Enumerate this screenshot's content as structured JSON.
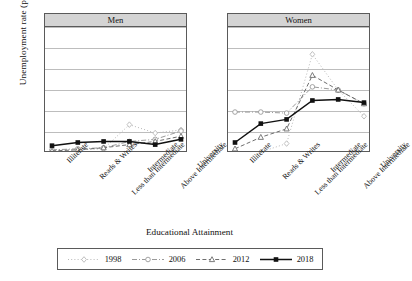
{
  "chart_data": {
    "type": "line",
    "title": "",
    "xlabel": "Educational Attainment",
    "ylabel": "Unemployment rate (percentage)",
    "ylim": [
      0,
      60
    ],
    "yticks": [
      0,
      10,
      20,
      30,
      40,
      50,
      60
    ],
    "grid": true,
    "legend_position": "bottom",
    "panels": [
      "Men",
      "Women"
    ],
    "categories": [
      "Illiterate",
      "Reads & Writes",
      "Less than Intermediate",
      "Intermediate",
      "Above Intermediate",
      "University"
    ],
    "panel_data": [
      {
        "panel": "Men",
        "series": [
          {
            "name": "1998",
            "values": [
              1.5,
              1.5,
              2.0,
              13.5,
              9.5,
              11.0
            ]
          },
          {
            "name": "2006",
            "values": [
              1.5,
              2.0,
              2.5,
              5.5,
              6.5,
              10.5
            ]
          },
          {
            "name": "2012",
            "values": [
              1.0,
              1.5,
              2.5,
              4.0,
              5.5,
              8.0
            ]
          },
          {
            "name": "2018",
            "values": [
              3.5,
              5.0,
              5.5,
              5.5,
              4.0,
              6.5
            ]
          }
        ]
      },
      {
        "panel": "Women",
        "series": [
          {
            "name": "1998",
            "values": [
              0.5,
              0.5,
              4.5,
              47.0,
              30.0,
              17.5
            ]
          },
          {
            "name": "2006",
            "values": [
              19.5,
              19.5,
              19.0,
              31.5,
              30.0,
              23.5
            ]
          },
          {
            "name": "2012",
            "values": [
              2.0,
              7.5,
              11.5,
              37.0,
              30.0,
              23.5
            ]
          },
          {
            "name": "2018",
            "values": [
              5.0,
              14.0,
              16.0,
              25.0,
              25.5,
              24.0
            ]
          }
        ]
      }
    ],
    "legend": [
      {
        "label": "1998",
        "marker": "diamond-open",
        "dash": "dotted",
        "color": "#b9b9b9"
      },
      {
        "label": "2006",
        "marker": "circle-open",
        "dash": "dashdot",
        "color": "#9a9a9a"
      },
      {
        "label": "2012",
        "marker": "triangle-open",
        "dash": "dashed",
        "color": "#6e6e6e"
      },
      {
        "label": "2018",
        "marker": "square-filled",
        "dash": "solid",
        "color": "#111111"
      }
    ]
  },
  "panels": {
    "men": {
      "title": "Men"
    },
    "women": {
      "title": "Women"
    }
  },
  "axes": {
    "y_title": "Unemployment rate (percentage)",
    "x_title": "Educational Attainment"
  }
}
